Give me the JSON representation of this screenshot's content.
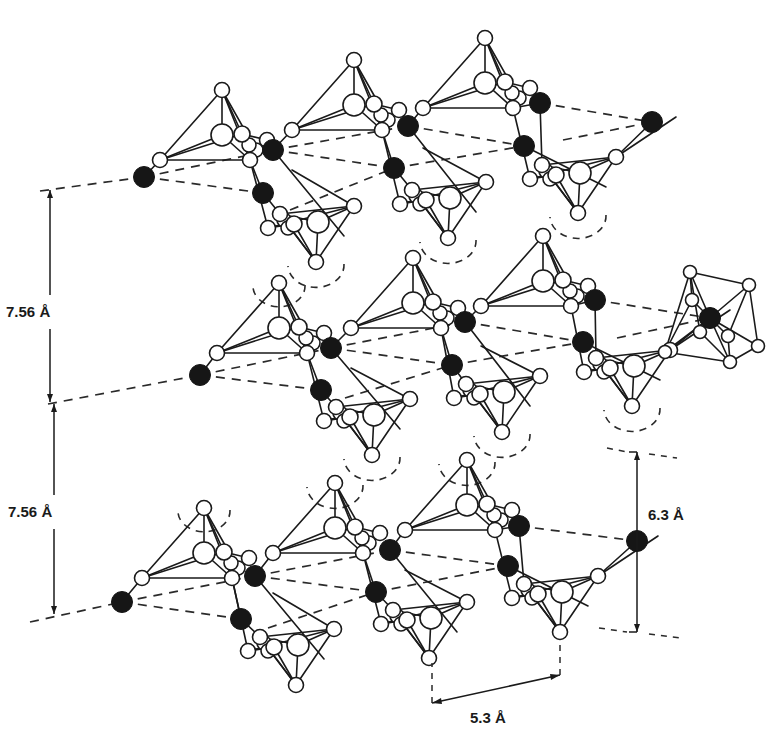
{
  "figure": {
    "colors": {
      "line": "#1a1a1a",
      "cation": "#161616",
      "background": "#ffffff"
    },
    "legend": {
      "open_circle": "oxygen / tetrahedral atom (open circle)",
      "filled_circle": "interlayer cation (filled circle)"
    }
  },
  "dimensions": {
    "interlayer_top": {
      "label": "7.56",
      "unit": "Å",
      "x": 50,
      "y1": 190,
      "y2": 402,
      "text_x": 6,
      "text_y": 317
    },
    "interlayer_bottom": {
      "label": "7.56",
      "unit": "Å",
      "x": 54,
      "y1": 404,
      "y2": 614,
      "text_x": 8,
      "text_y": 517
    },
    "c_axis": {
      "label": "6.3",
      "unit": "Å",
      "x": 637,
      "y1": 452,
      "y2": 632,
      "text_x": 648,
      "text_y": 520
    },
    "a_axis": {
      "label": "5.3",
      "unit": "Å",
      "x1": 432,
      "y1": 703,
      "x2": 560,
      "y2": 675,
      "text_x": 470,
      "text_y": 723
    }
  },
  "layers": [
    {
      "name": "top",
      "up_tetrahedra": [
        [
          222,
          90,
          220
        ],
        [
          354,
          60,
          220
        ],
        [
          485,
          38,
          220
        ]
      ],
      "down_tetrahedra": [
        [
          316,
          262,
          220
        ],
        [
          448,
          238,
          220
        ],
        [
          578,
          213,
          220
        ]
      ],
      "cations": [
        [
          144,
          177
        ],
        [
          273,
          150
        ],
        [
          263,
          193
        ],
        [
          408,
          126
        ],
        [
          394,
          168
        ],
        [
          524,
          146
        ],
        [
          540,
          103
        ],
        [
          652,
          122
        ]
      ],
      "dashed": [
        [
          [
            40,
            191
          ],
          [
            144,
            177
          ]
        ],
        [
          [
            144,
            177
          ],
          [
            273,
            150
          ]
        ],
        [
          [
            144,
            177
          ],
          [
            263,
            193
          ]
        ],
        [
          [
            273,
            150
          ],
          [
            408,
            126
          ]
        ],
        [
          [
            273,
            150
          ],
          [
            394,
            168
          ]
        ],
        [
          [
            290,
            210
          ],
          [
            394,
            168
          ]
        ],
        [
          [
            408,
            126
          ],
          [
            524,
            146
          ]
        ],
        [
          [
            394,
            168
          ],
          [
            524,
            146
          ]
        ],
        [
          [
            540,
            103
          ],
          [
            652,
            122
          ]
        ],
        [
          [
            563,
            140
          ],
          [
            652,
            122
          ]
        ]
      ],
      "arcs": [
        [
          316,
          262,
          28
        ],
        [
          448,
          238,
          28
        ],
        [
          578,
          213,
          28
        ]
      ]
    },
    {
      "name": "middle",
      "up_tetrahedra": [
        [
          279,
          283,
          220
        ],
        [
          413,
          258,
          220
        ],
        [
          543,
          236,
          220
        ]
      ],
      "down_tetrahedra": [
        [
          372,
          455,
          220
        ],
        [
          502,
          432,
          220
        ],
        [
          632,
          406,
          220
        ]
      ],
      "cations": [
        [
          200,
          375
        ],
        [
          331,
          348
        ],
        [
          321,
          390
        ],
        [
          465,
          322
        ],
        [
          452,
          365
        ],
        [
          583,
          342
        ],
        [
          595,
          300
        ],
        [
          710,
          318
        ]
      ],
      "dashed": [
        [
          [
            48,
            404
          ],
          [
            200,
            375
          ]
        ],
        [
          [
            200,
            375
          ],
          [
            331,
            348
          ]
        ],
        [
          [
            200,
            375
          ],
          [
            321,
            390
          ]
        ],
        [
          [
            331,
            348
          ],
          [
            465,
            322
          ]
        ],
        [
          [
            331,
            348
          ],
          [
            452,
            365
          ]
        ],
        [
          [
            345,
            398
          ],
          [
            452,
            365
          ]
        ],
        [
          [
            465,
            322
          ],
          [
            583,
            342
          ]
        ],
        [
          [
            452,
            365
          ],
          [
            583,
            342
          ]
        ],
        [
          [
            595,
            300
          ],
          [
            710,
            318
          ]
        ],
        [
          [
            617,
            338
          ],
          [
            710,
            318
          ]
        ]
      ],
      "arcs": [
        [
          372,
          455,
          28
        ],
        [
          502,
          432,
          28
        ],
        [
          632,
          406,
          28
        ],
        [
          279,
          283,
          26
        ]
      ],
      "octahedron": {
        "center": [
          710,
          318
        ],
        "vertices": [
          [
            690,
            272
          ],
          [
            749,
            285
          ],
          [
            758,
            346
          ],
          [
            730,
            362
          ],
          [
            665,
            352
          ],
          [
            692,
            300
          ],
          [
            728,
            336
          ],
          [
            700,
            332
          ]
        ]
      }
    },
    {
      "name": "bottom",
      "up_tetrahedra": [
        [
          204,
          508,
          220
        ],
        [
          335,
          483,
          220
        ],
        [
          467,
          460,
          220
        ]
      ],
      "down_tetrahedra": [
        [
          296,
          685,
          220
        ],
        [
          429,
          658,
          220
        ],
        [
          560,
          632,
          220
        ]
      ],
      "cations": [
        [
          122,
          602
        ],
        [
          255,
          576
        ],
        [
          241,
          619
        ],
        [
          390,
          550
        ],
        [
          376,
          592
        ],
        [
          508,
          566
        ],
        [
          519,
          526
        ],
        [
          637,
          541
        ]
      ],
      "dashed": [
        [
          [
            30,
            622
          ],
          [
            122,
            602
          ]
        ],
        [
          [
            122,
            602
          ],
          [
            255,
            576
          ]
        ],
        [
          [
            122,
            602
          ],
          [
            241,
            619
          ]
        ],
        [
          [
            255,
            576
          ],
          [
            390,
            550
          ]
        ],
        [
          [
            255,
            576
          ],
          [
            376,
            592
          ]
        ],
        [
          [
            268,
            628
          ],
          [
            376,
            592
          ]
        ],
        [
          [
            390,
            550
          ],
          [
            508,
            566
          ]
        ],
        [
          [
            376,
            592
          ],
          [
            508,
            566
          ]
        ],
        [
          [
            519,
            526
          ],
          [
            637,
            541
          ]
        ]
      ],
      "arcs": [
        [
          204,
          508,
          26
        ],
        [
          335,
          483,
          28
        ],
        [
          467,
          460,
          28
        ]
      ]
    }
  ]
}
